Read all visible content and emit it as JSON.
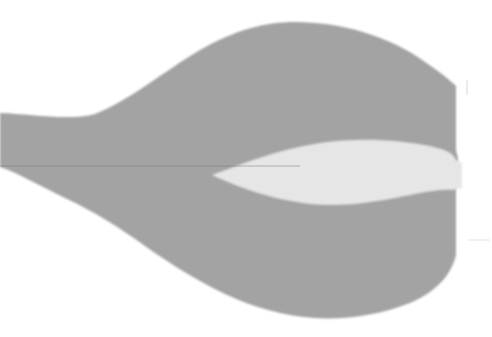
{
  "figure": {
    "colors": {
      "background": "#ffffff",
      "body": "#a3a3a3",
      "inner": "#e6e6e6",
      "line": "#7f7f7f",
      "faint_marks": "#d8d8d8"
    }
  }
}
